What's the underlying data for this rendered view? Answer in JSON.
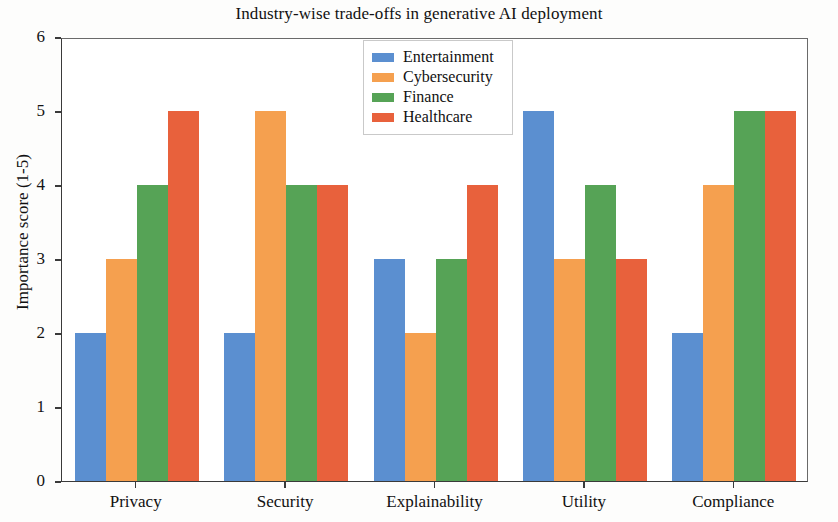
{
  "chart_data": {
    "type": "bar",
    "title": "Industry-wise trade-offs in generative AI deployment",
    "xlabel": "",
    "ylabel": "Importance score (1-5)",
    "categories": [
      "Privacy",
      "Security",
      "Explainability",
      "Utility",
      "Compliance"
    ],
    "series": [
      {
        "name": "Entertainment",
        "color": "#5b8fd0",
        "values": [
          2,
          2,
          3,
          5,
          2
        ]
      },
      {
        "name": "Cybersecurity",
        "color": "#f5a04f",
        "values": [
          3,
          5,
          2,
          3,
          4
        ]
      },
      {
        "name": "Finance",
        "color": "#56a356",
        "values": [
          4,
          4,
          3,
          4,
          5
        ]
      },
      {
        "name": "Healthcare",
        "color": "#e8613c",
        "values": [
          5,
          4,
          4,
          3,
          5
        ]
      }
    ],
    "ylim": [
      0,
      6
    ],
    "yticks": [
      0,
      1,
      2,
      3,
      4,
      5,
      6
    ],
    "ytick_labels": [
      "0",
      "1",
      "2",
      "3",
      "4",
      "5",
      "6"
    ],
    "grid": false,
    "legend_position": "upper center-left",
    "legend_entries": [
      "Entertainment",
      "Cybersecurity",
      "Finance",
      "Healthcare"
    ]
  }
}
